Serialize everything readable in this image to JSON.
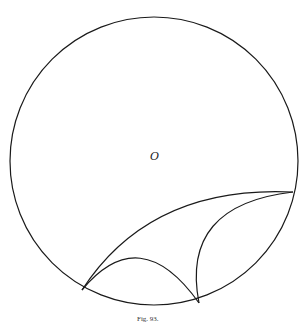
{
  "figure": {
    "center_label": "O",
    "caption": "Fig. 93."
  },
  "colors": {
    "stroke": "#1a1a1a",
    "background": "#ffffff"
  }
}
